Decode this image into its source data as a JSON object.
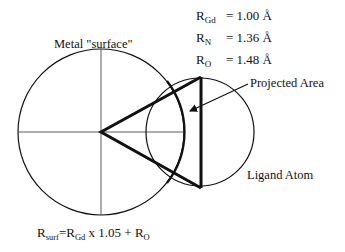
{
  "labels": {
    "metal_surface": "Metal \"surface\"",
    "projected_area": "Projected Area",
    "ligand_atom": "Ligand Atom"
  },
  "radii": [
    {
      "symbol": "R",
      "sub": "Gd",
      "eq": "= 1.00 Å"
    },
    {
      "symbol": "R",
      "sub": "N",
      "eq": "= 1.36 Å"
    },
    {
      "symbol": "R",
      "sub": "O",
      "eq": "= 1.48 Å"
    }
  ],
  "formula": {
    "r": "R",
    "r_sub": "surf",
    "mid": "=R",
    "gd_sub": "Gd",
    "rest": " x 1.05 + R",
    "o_sub": "O"
  },
  "geometry": {
    "metal_circle": {
      "cx": 101,
      "cy": 132,
      "r": 83
    },
    "ligand_circle": {
      "cx": 200,
      "cy": 132,
      "r": 54
    },
    "triangle": {
      "apex": [
        101,
        132
      ],
      "top": [
        201,
        77
      ],
      "bottom": [
        201,
        188
      ]
    },
    "stroke_color": "#111111"
  }
}
